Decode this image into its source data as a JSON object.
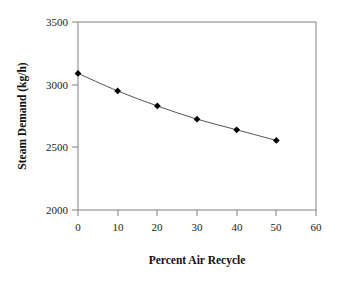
{
  "chart_data": {
    "type": "line",
    "title": "",
    "subtitle": "",
    "xlabel": "Percent Air Recycle",
    "ylabel": "Steam Demand (kg/h)",
    "x": [
      0,
      10,
      20,
      30,
      40,
      50
    ],
    "values": [
      3090,
      2950,
      2830,
      2725,
      2640,
      2555
    ],
    "series": [
      {
        "name": "Steam Demand",
        "x": [
          0,
          10,
          20,
          30,
          40,
          50
        ],
        "values": [
          3090,
          2950,
          2830,
          2725,
          2640,
          2555
        ]
      }
    ],
    "xlim": [
      0,
      60
    ],
    "ylim": [
      2000,
      3500
    ],
    "xticks": [
      0,
      10,
      20,
      30,
      40,
      50,
      60
    ],
    "yticks": [
      2000,
      2500,
      3000,
      3500
    ],
    "xtick_labels": [
      "0",
      "10",
      "20",
      "30",
      "40",
      "50",
      "60"
    ],
    "ytick_labels": [
      "2000",
      "2500",
      "3000",
      "3500"
    ],
    "grid": false,
    "legend": false,
    "legend_position": "none",
    "marker": "diamond",
    "marker_color": "#000000",
    "line_color": "#555555",
    "axis_color": "#808080",
    "background_color": "#ffffff",
    "text_color": "#111111"
  }
}
